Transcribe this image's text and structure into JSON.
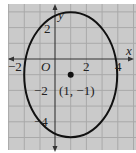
{
  "diagram": {
    "type": "ellipse-graph",
    "axes": {
      "x_label": "x",
      "y_label": "y",
      "origin_label": "O",
      "x_ticks": [
        {
          "value": -2,
          "label": "−2"
        },
        {
          "value": 2,
          "label": "2"
        },
        {
          "value": 4,
          "label": "4"
        }
      ],
      "y_ticks": [
        {
          "value": 2,
          "label": "2"
        },
        {
          "value": -2,
          "label": "−2"
        },
        {
          "value": -4,
          "label": "−4"
        }
      ]
    },
    "ellipse": {
      "center": {
        "x": 1,
        "y": -1
      },
      "semi_axis_x": 3,
      "semi_axis_y": 4
    },
    "center_point": {
      "label": "(1, −1)"
    },
    "colors": {
      "background": "#c9c9c9",
      "grid": "#a8a8a8",
      "curve": "#111111",
      "axis": "#333333"
    }
  }
}
